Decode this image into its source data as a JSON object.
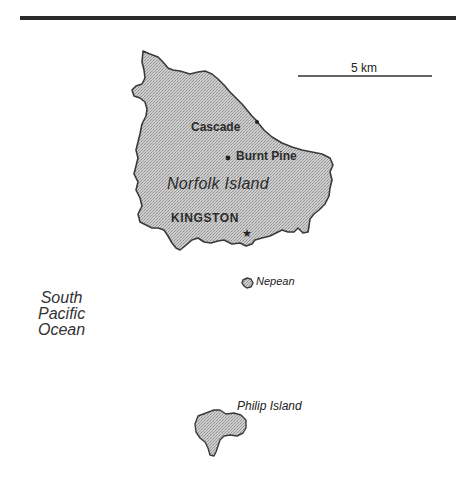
{
  "map": {
    "scale_bar": {
      "label": "5 km"
    },
    "places": {
      "cascade": "Cascade",
      "burnt_pine": "Burnt Pine",
      "kingston": "KINGSTON"
    },
    "islands": {
      "norfolk": "Norfolk Island",
      "nepean": "Nepean",
      "philip": "Philip Island"
    },
    "ocean": {
      "line1": "South",
      "line2": "Pacific",
      "line3": "Ocean"
    },
    "colors": {
      "land_fill": "#c4c4c4",
      "outline": "#3a3a3a",
      "rule": "#2a2a2a"
    }
  }
}
